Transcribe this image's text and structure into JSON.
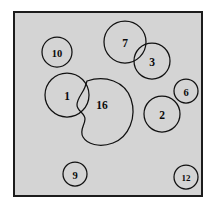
{
  "figure": {
    "name": "shape-cluster-diagram",
    "background_color": "#d4d4d4",
    "border_color": "#1c1c1c",
    "outline_color": "#111111",
    "label_color": "#0b0b0b",
    "page_background": "#ffffff"
  },
  "shapes": [
    {
      "id": "shape-10",
      "label": "10",
      "kind": "circle",
      "cx": 42,
      "cy": 39,
      "r": 15,
      "label_size": "label-md"
    },
    {
      "id": "shape-7",
      "label": "7",
      "kind": "circle",
      "cx": 110,
      "cy": 29,
      "r": 21,
      "label_size": "label-lg"
    },
    {
      "id": "shape-3",
      "label": "3",
      "kind": "circle",
      "cx": 137,
      "cy": 48,
      "r": 18,
      "label_size": "label-lg"
    },
    {
      "id": "shape-6",
      "label": "6",
      "kind": "circle",
      "cx": 171,
      "cy": 78,
      "r": 12,
      "label_size": "label-md"
    },
    {
      "id": "shape-1",
      "label": "1",
      "kind": "circle",
      "cx": 52,
      "cy": 82,
      "r": 22,
      "label_size": "label-lg"
    },
    {
      "id": "shape-16",
      "label": "16",
      "kind": "blob",
      "cx": 87,
      "cy": 92,
      "path": "M 72 68 C 90 62, 110 68, 116 86 C 122 104, 114 124, 98 130 C 84 135, 72 131, 68 124 C 64 117, 70 112, 70 106 C 70 100, 62 98, 62 92 C 62 85, 68 80, 70 74 Z",
      "label_size": "label-lg"
    },
    {
      "id": "shape-2",
      "label": "2",
      "kind": "circle",
      "cx": 147,
      "cy": 101,
      "r": 18,
      "label_size": "label-lg"
    },
    {
      "id": "shape-9",
      "label": "9",
      "kind": "circle",
      "cx": 60,
      "cy": 161,
      "r": 12,
      "label_size": "label-md"
    },
    {
      "id": "shape-12",
      "label": "12",
      "kind": "circle",
      "cx": 171,
      "cy": 164,
      "r": 12,
      "label_size": "label-sm"
    }
  ]
}
